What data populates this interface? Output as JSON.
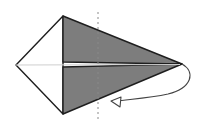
{
  "diagram": {
    "type": "origami-fold-step",
    "colors": {
      "background": "#ffffff",
      "paper_colored": "#7d7d7d",
      "paper_white": "#ffffff",
      "outline": "#1e1e1e",
      "dashed_line": "#9a9a9a",
      "arrow": "#444444"
    },
    "shape": {
      "left_tip": [
        16,
        65
      ],
      "top_corner": [
        63,
        16
      ],
      "bottom_corner": [
        63,
        114
      ],
      "right_tip": [
        182,
        64
      ]
    },
    "fold_line": {
      "style": "dashed",
      "x": 98,
      "y_start": 12,
      "y_end": 120
    },
    "arrow": {
      "description": "fold-behind arrow from right tip curving back under to left"
    }
  }
}
